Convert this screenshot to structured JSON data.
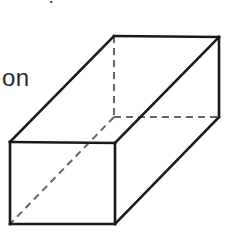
{
  "text": {
    "partial_label": "on",
    "top_fragment": "?"
  },
  "diagram": {
    "type": "rectangular-prism",
    "stroke_color": "#1a1a1a",
    "hidden_stroke_color": "#666666",
    "vertices": {
      "front_top_left": [
        10,
        142
      ],
      "front_top_right": [
        115,
        143
      ],
      "front_bottom_left": [
        10,
        224
      ],
      "front_bottom_right": [
        115,
        224
      ],
      "back_top_left": [
        114,
        36
      ],
      "back_top_right": [
        219,
        37
      ],
      "back_bottom_left": [
        114,
        117
      ],
      "back_bottom_right": [
        219,
        117
      ]
    },
    "solid_edges": [
      [
        "front_top_left",
        "front_top_right"
      ],
      [
        "front_top_right",
        "front_bottom_right"
      ],
      [
        "front_bottom_right",
        "front_bottom_left"
      ],
      [
        "front_bottom_left",
        "front_top_left"
      ],
      [
        "front_top_left",
        "back_top_left"
      ],
      [
        "back_top_left",
        "back_top_right"
      ],
      [
        "back_top_right",
        "back_bottom_right"
      ],
      [
        "back_bottom_right",
        "front_bottom_right"
      ],
      [
        "front_top_right",
        "back_top_right"
      ]
    ],
    "hidden_edges": [
      [
        "back_top_left",
        "back_bottom_left"
      ],
      [
        "back_bottom_left",
        "back_bottom_right"
      ],
      [
        "back_bottom_left",
        "front_bottom_left"
      ]
    ]
  }
}
